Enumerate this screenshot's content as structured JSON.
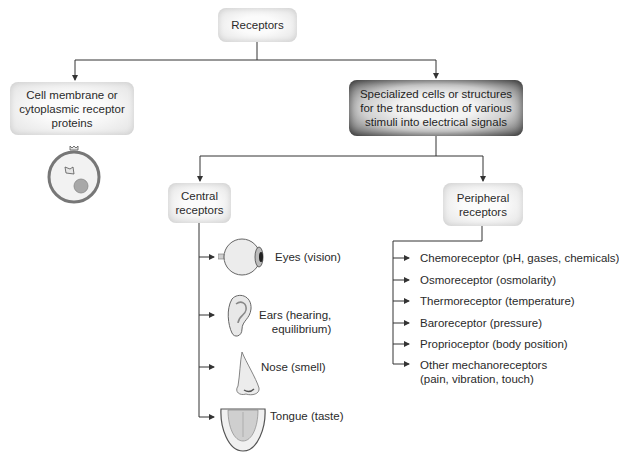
{
  "diagram": {
    "type": "hierarchy",
    "root": {
      "label": "Receptors"
    },
    "level1": {
      "left": {
        "line1": "Cell membrane or",
        "line2": "cytoplasmic receptor",
        "line3": "proteins",
        "illustration": "cell-icon"
      },
      "right": {
        "line1": "Specialized cells or structures",
        "line2": "for the transduction of various",
        "line3": "stimuli into electrical signals"
      }
    },
    "central": {
      "line1": "Central",
      "line2": "receptors",
      "items": [
        {
          "label": "Eyes (vision)",
          "icon": "eye-icon"
        },
        {
          "label_line1": "Ears (hearing,",
          "label_line2": "equilibrium)",
          "icon": "ear-icon"
        },
        {
          "label": "Nose (smell)",
          "icon": "nose-icon"
        },
        {
          "label": "Tongue (taste)",
          "icon": "tongue-icon"
        }
      ]
    },
    "peripheral": {
      "line1": "Peripheral",
      "line2": "receptors",
      "items": [
        {
          "label": "Chemoreceptor (pH, gases, chemicals)"
        },
        {
          "label": "Osmoreceptor (osmolarity)"
        },
        {
          "label": "Thermoreceptor (temperature)"
        },
        {
          "label": "Baroreceptor (pressure)"
        },
        {
          "label": "Proprioceptor (body position)"
        },
        {
          "label_line1": "Other mechanoreceptors",
          "label_line2": "(pain, vibration, touch)"
        }
      ]
    }
  },
  "colors": {
    "line": "#333333",
    "box_light": "#eeeeee",
    "box_dark": "#5a5a5a"
  }
}
